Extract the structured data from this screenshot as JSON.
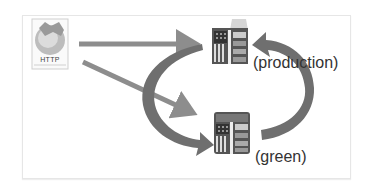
{
  "diagram": {
    "client": {
      "icon": "http-globe-icon",
      "label": "HTTP"
    },
    "servers": [
      {
        "id": "production",
        "icon": "server-icon",
        "label": "(production)"
      },
      {
        "id": "green",
        "icon": "server-icon",
        "label": "(green)"
      }
    ],
    "connections": [
      {
        "from": "HTTP",
        "to": "production",
        "style": "straight-arrow"
      },
      {
        "from": "HTTP",
        "to": "green",
        "style": "straight-arrow"
      },
      {
        "from": "production",
        "to": "green",
        "style": "curved-arrow-left"
      },
      {
        "from": "green",
        "to": "production",
        "style": "curved-arrow-right"
      }
    ],
    "colors": {
      "arrow": "#8a8a8a",
      "curved_arrow": "#6e6e6e",
      "text": "#333333",
      "frame_border": "#e6e6e6"
    }
  }
}
